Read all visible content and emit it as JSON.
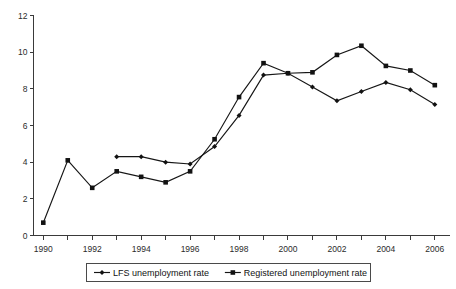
{
  "chart_data": {
    "type": "line",
    "title": "",
    "xlabel": "",
    "ylabel": "",
    "x": [
      1990,
      1991,
      1992,
      1993,
      1994,
      1995,
      1996,
      1997,
      1998,
      1999,
      2000,
      2001,
      2002,
      2003,
      2004,
      2005,
      2006
    ],
    "xtick_labels": [
      "1990",
      "1992",
      "1994",
      "1996",
      "1998",
      "2000",
      "2002",
      "2004",
      "2006"
    ],
    "xtick_values": [
      1990,
      1992,
      1994,
      1996,
      1998,
      2000,
      2002,
      2004,
      2006
    ],
    "xlim": [
      1989.6,
      2006.6
    ],
    "ytick_labels": [
      "0",
      "2",
      "4",
      "6",
      "8",
      "10",
      "12"
    ],
    "ytick_values": [
      0,
      2,
      4,
      6,
      8,
      10,
      12
    ],
    "ylim": [
      0,
      12
    ],
    "grid": false,
    "legend_position": "bottom",
    "series": [
      {
        "name": "LFS unemployment rate",
        "marker": "diamond",
        "color": "#121212",
        "x": [
          1993,
          1994,
          1995,
          1996,
          1997,
          1998,
          1999,
          2000,
          2001,
          2002,
          2003,
          2004,
          2005,
          2006
        ],
        "values": [
          4.3,
          4.3,
          4.0,
          3.9,
          4.85,
          6.55,
          8.75,
          8.85,
          8.1,
          7.35,
          7.85,
          8.35,
          7.95,
          7.15
        ]
      },
      {
        "name": "Registered unemployment rate",
        "marker": "square",
        "color": "#121212",
        "x": [
          1990,
          1991,
          1992,
          1993,
          1994,
          1995,
          1996,
          1997,
          1998,
          1999,
          2000,
          2001,
          2002,
          2003,
          2004,
          2005,
          2006
        ],
        "values": [
          0.7,
          4.1,
          2.6,
          3.5,
          3.2,
          2.9,
          3.5,
          5.25,
          7.55,
          9.4,
          8.85,
          8.9,
          9.85,
          10.35,
          9.25,
          9.0,
          8.2
        ]
      }
    ]
  },
  "legend": {
    "entries": [
      {
        "label": "LFS unemployment rate",
        "marker": "diamond"
      },
      {
        "label": "Registered unemployment rate",
        "marker": "square"
      }
    ]
  }
}
